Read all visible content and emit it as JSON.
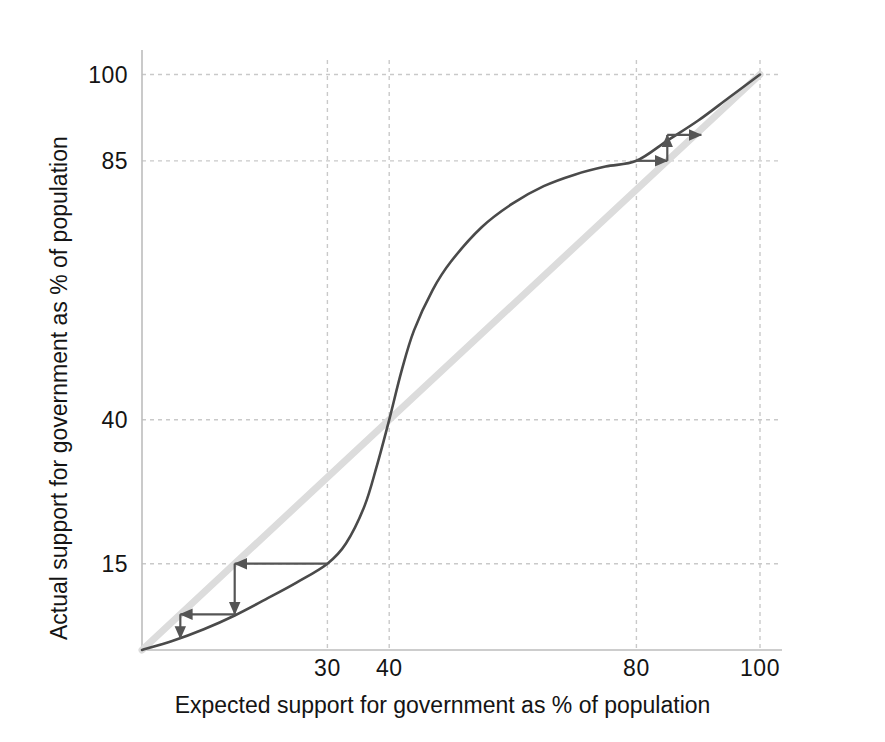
{
  "chart_data": {
    "type": "line",
    "title": "",
    "xlabel": "Expected support for government as % of population",
    "ylabel": "Actual support for government as % of population",
    "xlim": [
      0,
      104
    ],
    "ylim": [
      0,
      104
    ],
    "grid": true,
    "legend": "none",
    "xticks": [
      30,
      40,
      80,
      100
    ],
    "yticks": [
      15,
      40,
      85,
      100
    ],
    "xtick_labels": [
      "30",
      "40",
      "80",
      "100"
    ],
    "ytick_labels": [
      "15",
      "40",
      "85",
      "100"
    ],
    "series": [
      {
        "name": "Actual support response curve",
        "type": "line",
        "color": "#4a4a4a",
        "width": 2.6,
        "points": [
          [
            0,
            0
          ],
          [
            5,
            1.6
          ],
          [
            10,
            3.6
          ],
          [
            15,
            6.0
          ],
          [
            20,
            8.8
          ],
          [
            25,
            11.7
          ],
          [
            30,
            15.0
          ],
          [
            33,
            18.5
          ],
          [
            36,
            25.0
          ],
          [
            38,
            32.0
          ],
          [
            40,
            40.0
          ],
          [
            42,
            48.5
          ],
          [
            44,
            55.5
          ],
          [
            47,
            62.5
          ],
          [
            50,
            67.5
          ],
          [
            55,
            73.5
          ],
          [
            60,
            77.6
          ],
          [
            65,
            80.6
          ],
          [
            70,
            82.6
          ],
          [
            75,
            84.0
          ],
          [
            80,
            85.0
          ],
          [
            85,
            88.5
          ],
          [
            90,
            92.0
          ],
          [
            95,
            96.0
          ],
          [
            100,
            100.0
          ]
        ]
      },
      {
        "name": "45 degree reference line (y = x)",
        "type": "line",
        "color": "#dcdcdc",
        "width": 7,
        "points": [
          [
            0,
            0
          ],
          [
            100,
            100
          ]
        ]
      }
    ],
    "fixed_points": [
      {
        "name": "low-equilibrium",
        "x": 0,
        "y": 0,
        "stability": "stable"
      },
      {
        "name": "tipping-point",
        "x": 40,
        "y": 40,
        "stability": "unstable"
      },
      {
        "name": "high-equilibrium",
        "x": 100,
        "y": 100,
        "stability": "stable"
      }
    ],
    "cobweb_upper": {
      "name": "upper cobweb converging to 100",
      "color": "#555555",
      "segments": [
        {
          "from": [
            80,
            85
          ],
          "to": [
            85,
            85
          ],
          "direction": "right"
        },
        {
          "from": [
            85,
            85
          ],
          "to": [
            85,
            89.5
          ],
          "direction": "up"
        },
        {
          "from": [
            85,
            89.5
          ],
          "to": [
            90.5,
            89.5
          ],
          "direction": "right"
        }
      ]
    },
    "cobweb_lower": {
      "name": "lower cobweb converging to 0",
      "color": "#555555",
      "segments": [
        {
          "from": [
            30,
            15
          ],
          "to": [
            15,
            15
          ],
          "direction": "left"
        },
        {
          "from": [
            15,
            15
          ],
          "to": [
            15,
            6.2
          ],
          "direction": "down"
        },
        {
          "from": [
            15,
            6.2
          ],
          "to": [
            6.2,
            6.2
          ],
          "direction": "left"
        },
        {
          "from": [
            6.2,
            6.2
          ],
          "to": [
            6.2,
            2.0
          ],
          "direction": "down"
        }
      ]
    }
  },
  "axes": {
    "x_title": "Expected support for government as % of population",
    "y_title": "Actual support for government as % of population",
    "x_ticks": [
      {
        "value": 30,
        "label": "30"
      },
      {
        "value": 40,
        "label": "40"
      },
      {
        "value": 80,
        "label": "80"
      },
      {
        "value": 100,
        "label": "100"
      }
    ],
    "y_ticks": [
      {
        "value": 15,
        "label": "15"
      },
      {
        "value": 40,
        "label": "40"
      },
      {
        "value": 85,
        "label": "85"
      },
      {
        "value": 100,
        "label": "100"
      }
    ]
  },
  "colors": {
    "curve": "#4a4a4a",
    "diagonal": "#dcdcdc",
    "arrow": "#555555",
    "grid": "#c9c9c9",
    "axis": "#bdbdbd",
    "text": "#141414",
    "background": "#ffffff"
  }
}
